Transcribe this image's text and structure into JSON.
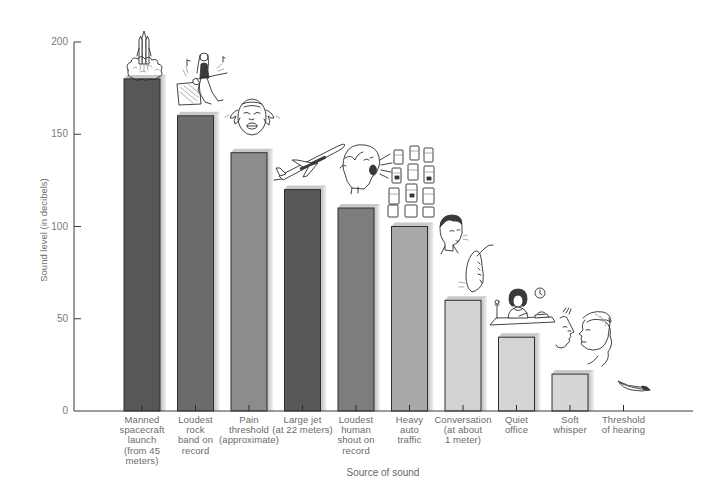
{
  "chart_data": {
    "type": "bar",
    "title": "",
    "xlabel": "Source of sound",
    "ylabel": "Sound level (in decibels)",
    "ylim": [
      0,
      200
    ],
    "yticks": [
      0,
      50,
      100,
      150,
      200
    ],
    "grid": false,
    "legend": null,
    "categories": [
      "Manned\nspacecraft\nlaunch\n(from 45\nmeters)",
      "Loudest\nrock\nband on\nrecord",
      "Pain\nthreshold\n(approximate)",
      "Large jet\n(at 22 meters)",
      "Loudest\nhuman\nshout on\nrecord",
      "Heavy\nauto\ntraffic",
      "Conversation\n(at about\n1 meter)",
      "Quiet\noffice",
      "Soft\nwhisper",
      "Threshold\nof hearing"
    ],
    "values": [
      180,
      160,
      140,
      120,
      110,
      100,
      60,
      40,
      20,
      0
    ],
    "bar_colors": [
      "#575757",
      "#6b6b6b",
      "#8c8c8c",
      "#585858",
      "#7d7d7d",
      "#a9a9a9",
      "#d2d2d2",
      "#d4d4d4",
      "#d6d6d6",
      "#d6d6d6"
    ],
    "illustrations": [
      "rocket-launch-illustration",
      "rock-guitarist-illustration",
      "pain-face-illustration",
      "jet-plane-illustration",
      "shouting-head-illustration",
      "traffic-cars-illustration",
      "talking-man-ear-illustration",
      "woman-at-desk-illustration",
      "whispering-faces-illustration",
      "feather-illustration"
    ]
  },
  "colors": {
    "axis": "#3a3a3a",
    "text": "#6a6a6a",
    "bar_side_light": "#f0f0f0",
    "bar_side_dark": "#bdbdbd",
    "bar_top": "#c9c9c9"
  }
}
